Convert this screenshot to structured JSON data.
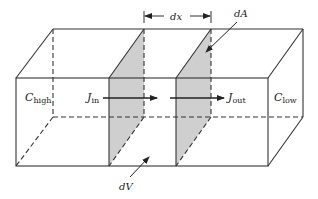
{
  "diagram": {
    "type": "3D box with two cross-section slabs (diffusion control volume)",
    "labels": {
      "c_high": {
        "main": "C",
        "sub": "high"
      },
      "c_low": {
        "main": "C",
        "sub": "low"
      },
      "j_in": {
        "main": "J",
        "sub": "in"
      },
      "j_out": {
        "main": "J",
        "sub": "out"
      },
      "dx": "dx",
      "dA": "dA",
      "dV": "dV"
    },
    "colors": {
      "stroke": "#333333",
      "slab_fill": "#cfcfcf",
      "background": "#ffffff"
    }
  }
}
